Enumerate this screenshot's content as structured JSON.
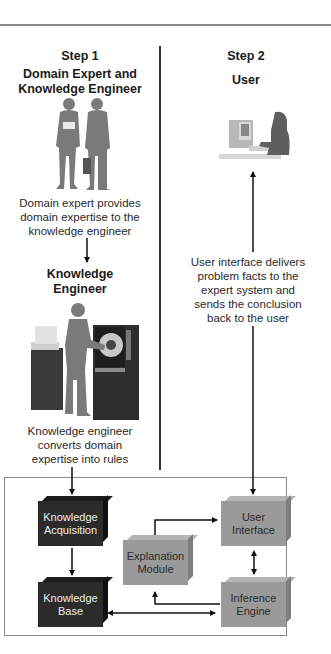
{
  "step1": {
    "label": "Step 1",
    "title_line1": "Domain Expert and",
    "title_line2": "Knowledge Engineer",
    "caption1": [
      "Domain expert provides",
      "domain expertise to the",
      "knowledge engineer"
    ],
    "ke_title_line1": "Knowledge",
    "ke_title_line2": "Engineer",
    "caption2": [
      "Knowledge engineer",
      "converts domain",
      "expertise into rules"
    ]
  },
  "step2": {
    "label": "Step 2",
    "title": "User",
    "caption": [
      "User interface delivers",
      "problem facts to the",
      "expert system and",
      "sends the conclusion",
      "back to the user"
    ]
  },
  "system": {
    "knowledge_acquisition": [
      "Knowledge",
      "Acquisition"
    ],
    "knowledge_base": [
      "Knowledge",
      "Base"
    ],
    "explanation_module": [
      "Explanation",
      "Module"
    ],
    "user_interface": [
      "User",
      "Interface"
    ],
    "inference_engine": [
      "Inference",
      "Engine"
    ]
  },
  "colors": {
    "dark_box": "#2b2b2b",
    "light_box": "#9a9a9a",
    "figure": "#7a7a7a",
    "frame": "#8a8a8a"
  }
}
